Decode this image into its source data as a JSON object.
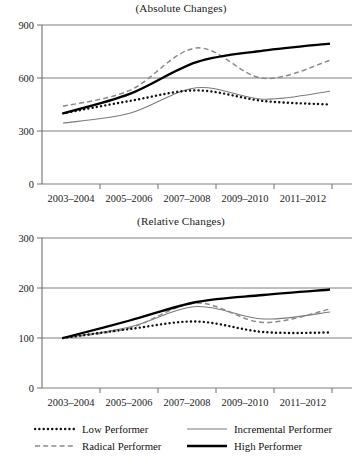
{
  "figure": {
    "width": 362,
    "height": 470,
    "background": "#ffffff"
  },
  "panels": [
    {
      "id": "absolute",
      "title": "(Absolute Changes)"
    },
    {
      "id": "relative",
      "title": "(Relative Changes)"
    }
  ],
  "legend": {
    "position": "bottom",
    "items": [
      {
        "label": "Low Performer",
        "style": "dotted",
        "color": "#111111"
      },
      {
        "label": "Incremental Performer",
        "style": "thin-solid",
        "color": "#7a7a7a"
      },
      {
        "label": "Radical Performer",
        "style": "dashed",
        "color": "#8a8a8a"
      },
      {
        "label": "High Performer",
        "style": "thick-solid",
        "color": "#000000"
      }
    ]
  },
  "colors": {
    "low_performer": "#111111",
    "radical_performer": "#8a8a8a",
    "incremental_performer": "#7a7a7a",
    "high_performer": "#000000",
    "gridline": "#6f6f6f",
    "axis": "#6f6f6f"
  },
  "chart_data": [
    {
      "type": "line",
      "title": "(Absolute Changes)",
      "xlabel": "",
      "ylabel": "",
      "categories": [
        "2003–2004",
        "2005–2006",
        "2007–2008",
        "2009–2010",
        "2011–2012"
      ],
      "x": [
        2003.5,
        2005.5,
        2007.5,
        2009.5,
        2011.5
      ],
      "ylim": [
        0,
        900
      ],
      "yticks": [
        0,
        300,
        600,
        900
      ],
      "grid": true,
      "legend_position": "bottom",
      "series": [
        {
          "name": "Low Performer",
          "values": [
            400,
            470,
            530,
            470,
            450
          ]
        },
        {
          "name": "Radical Performer",
          "values": [
            440,
            530,
            770,
            598,
            700
          ]
        },
        {
          "name": "Incremental Performer",
          "values": [
            345,
            400,
            545,
            480,
            525
          ]
        },
        {
          "name": "High Performer",
          "values": [
            400,
            510,
            690,
            755,
            795
          ]
        }
      ]
    },
    {
      "type": "line",
      "title": "(Relative Changes)",
      "xlabel": "",
      "ylabel": "",
      "categories": [
        "2003–2004",
        "2005–2006",
        "2007–2008",
        "2009–2010",
        "2011–2012"
      ],
      "x": [
        2003.5,
        2005.5,
        2007.5,
        2009.5,
        2011.5
      ],
      "ylim": [
        0,
        300
      ],
      "yticks": [
        0,
        100,
        200,
        300
      ],
      "grid": true,
      "legend_position": "bottom",
      "series": [
        {
          "name": "Low Performer",
          "values": [
            100,
            118,
            133,
            112,
            111
          ]
        },
        {
          "name": "Radical Performer",
          "values": [
            100,
            120,
            170,
            131,
            158
          ]
        },
        {
          "name": "Incremental Performer",
          "values": [
            100,
            122,
            163,
            138,
            152
          ]
        },
        {
          "name": "High Performer",
          "values": [
            100,
            135,
            172,
            186,
            197
          ]
        }
      ]
    }
  ],
  "axes": {
    "absolute": {
      "ytick_labels": [
        "900",
        "600",
        "300",
        "0"
      ],
      "xtick_labels": [
        "2003–2004",
        "2005–2006",
        "2007–2008",
        "2009–2010",
        "2011–2012"
      ]
    },
    "relative": {
      "ytick_labels": [
        "300",
        "200",
        "100",
        "0"
      ],
      "xtick_labels": [
        "2003–2004",
        "2005–2006",
        "2007–2008",
        "2009–2010",
        "2011–2012"
      ]
    }
  }
}
